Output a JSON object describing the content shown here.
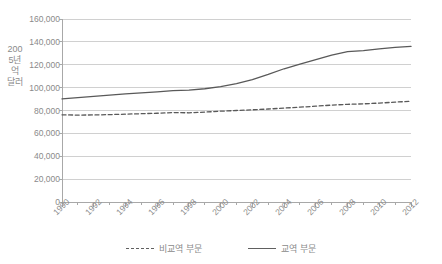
{
  "chart_data": {
    "type": "line",
    "title": "",
    "xlabel": "",
    "ylabel": "2005년 억 달러",
    "xlim": [
      1990,
      2012
    ],
    "ylim": [
      0,
      160000
    ],
    "grid": true,
    "legend_position": "bottom",
    "x": [
      1990,
      1991,
      1992,
      1993,
      1994,
      1995,
      1996,
      1997,
      1998,
      1999,
      2000,
      2001,
      2002,
      2003,
      2004,
      2005,
      2006,
      2007,
      2008,
      2009,
      2010,
      2011,
      2012
    ],
    "xtick_labels": [
      "1990",
      "1992",
      "1994",
      "1996",
      "1998",
      "2000",
      "2002",
      "2004",
      "2006",
      "2008",
      "2010",
      "2012"
    ],
    "xtick_values": [
      1990,
      1992,
      1994,
      1996,
      1998,
      2000,
      2002,
      2004,
      2006,
      2008,
      2010,
      2012
    ],
    "ytick_labels": [
      "0",
      "20,000",
      "40,000",
      "60,000",
      "80,000",
      "100,000",
      "120,000",
      "140,000",
      "160,000"
    ],
    "ytick_values": [
      0,
      20000,
      40000,
      60000,
      80000,
      100000,
      120000,
      140000,
      160000
    ],
    "series": [
      {
        "name": "비교역 부문",
        "style": "dashed",
        "color": "#595959",
        "values": [
          76200,
          76000,
          76100,
          76400,
          76800,
          77200,
          77600,
          78200,
          78000,
          78600,
          79400,
          80000,
          80600,
          81300,
          82100,
          82900,
          83800,
          84700,
          85400,
          85800,
          86500,
          87300,
          88100
        ]
      },
      {
        "name": "교역 부문",
        "style": "solid",
        "color": "#595959",
        "values": [
          90200,
          91300,
          92400,
          93500,
          94500,
          95400,
          96300,
          97400,
          97900,
          99000,
          100800,
          103500,
          107000,
          111500,
          116500,
          120500,
          124500,
          128500,
          131500,
          132300,
          133800,
          135200,
          136000
        ]
      }
    ]
  },
  "legend": {
    "entries": [
      {
        "label": "비교역 부문",
        "style": "dashed"
      },
      {
        "label": "교역 부문",
        "style": "solid"
      }
    ]
  },
  "colors": {
    "line": "#595959",
    "grid": "#d0d0d0",
    "axis": "#a8a8a8",
    "text": "#8a8a8a"
  }
}
